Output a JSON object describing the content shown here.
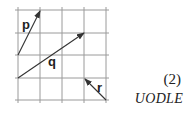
{
  "diagram": {
    "type": "vector-grid",
    "grid": {
      "columns": 4,
      "rows": 4,
      "line_color": "#9a9a9a",
      "vertical_lines_x": [
        18,
        40,
        62,
        84,
        106
      ],
      "horizontal_lines_y": [
        10,
        33,
        55,
        78,
        100
      ]
    },
    "vectors": [
      {
        "label": "p",
        "from": [
          0,
          2
        ],
        "to": [
          1,
          0
        ],
        "components": [
          1,
          2
        ]
      },
      {
        "label": "q",
        "from": [
          0,
          3
        ],
        "to": [
          3,
          1
        ],
        "components": [
          3,
          2
        ]
      },
      {
        "label": "r",
        "from": [
          4,
          4
        ],
        "to": [
          3,
          3
        ],
        "components": [
          -1,
          1
        ]
      }
    ],
    "vector_color": "#333333"
  },
  "marks": {
    "count": "(2)",
    "source": "UODLE"
  }
}
